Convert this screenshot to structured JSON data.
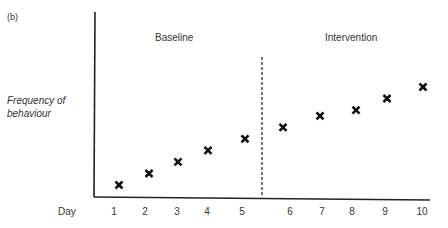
{
  "chart_data": {
    "type": "scatter",
    "panel_label": "(b)",
    "title": "",
    "xlabel": "Day",
    "ylabel": "Frequency of behaviour",
    "phases": [
      {
        "name": "Baseline",
        "days": [
          1,
          2,
          3,
          4,
          5
        ]
      },
      {
        "name": "Intervention",
        "days": [
          6,
          7,
          8,
          9,
          10
        ]
      }
    ],
    "phase_divider": "between day 5 and day 6 (dashed vertical line)",
    "categories": [
      "1",
      "2",
      "3",
      "4",
      "5",
      "6",
      "7",
      "8",
      "9",
      "10"
    ],
    "x": [
      1,
      2,
      3,
      4,
      5,
      6,
      7,
      8,
      9,
      10
    ],
    "values": [
      1,
      2,
      3,
      4,
      5,
      6,
      7,
      7.5,
      8.5,
      9.5
    ],
    "marker": "x",
    "y_ticks": "none",
    "grid": false,
    "legend": "none"
  },
  "labels": {
    "panel": "(b)",
    "baseline": "Baseline",
    "intervention": "Intervention",
    "ylabel_line1": "Frequency of",
    "ylabel_line2": "behaviour",
    "xlabel": "Day",
    "ticks": [
      "1",
      "2",
      "3",
      "4",
      "5",
      "6",
      "7",
      "8",
      "9",
      "10"
    ]
  }
}
